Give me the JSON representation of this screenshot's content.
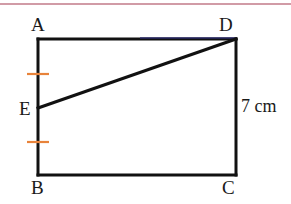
{
  "figure": {
    "background_color": "#ffffff",
    "stroke_color": "#111111",
    "top_edge_tint_color": "#2a2a6e",
    "tick_color": "#e8833a",
    "rule_color": "#c98a96"
  },
  "top_rule": {
    "name": "top-divider-rule",
    "color": "#c98a96"
  },
  "labels": {
    "A": "A",
    "B": "B",
    "C": "C",
    "D": "D",
    "E": "E"
  },
  "measurements": {
    "side_dc": "7 cm"
  },
  "geometry": {
    "rectangle": {
      "A": {
        "x": 38,
        "y": 39
      },
      "D": {
        "x": 236,
        "y": 39
      },
      "C": {
        "x": 236,
        "y": 175
      },
      "B": {
        "x": 38,
        "y": 175
      },
      "stroke_width": 3
    },
    "point_E": {
      "x": 38,
      "y": 108,
      "on_segment": "AB"
    },
    "diagonal_ED": {
      "from": {
        "x": 38,
        "y": 108
      },
      "to": {
        "x": 236,
        "y": 39
      },
      "stroke_width": 3
    },
    "tick_marks": [
      {
        "name": "tick-AE",
        "cx": 38,
        "cy": 74,
        "half_width": 11,
        "stroke_width": 2
      },
      {
        "name": "tick-EB",
        "cx": 38,
        "cy": 142,
        "half_width": 11,
        "stroke_width": 2
      }
    ],
    "top_edge_tint": {
      "from": {
        "x": 140,
        "y": 39
      },
      "to": {
        "x": 236,
        "y": 39
      }
    }
  }
}
